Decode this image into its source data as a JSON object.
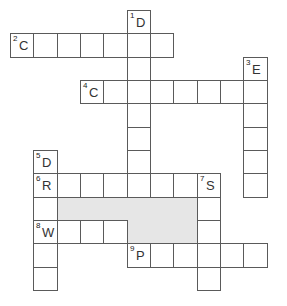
{
  "puzzle": {
    "type": "crossword",
    "cell_size": 23.33,
    "origin": [
      10,
      10
    ],
    "line_color": "#5a5a5a",
    "shade_color": "#e6e6e6",
    "entries": [
      {
        "number": "1",
        "letter": "D",
        "direction": "down",
        "col": 5,
        "row": 0,
        "length": 8
      },
      {
        "number": "2",
        "letter": "C",
        "direction": "across",
        "col": 0,
        "row": 1,
        "length": 7
      },
      {
        "number": "3",
        "letter": "E",
        "direction": "down",
        "col": 10,
        "row": 2,
        "length": 6
      },
      {
        "number": "4",
        "letter": "C",
        "direction": "across",
        "col": 3,
        "row": 3,
        "length": 8
      },
      {
        "number": "5",
        "letter": "D",
        "direction": "down",
        "col": 1,
        "row": 6,
        "length": 6
      },
      {
        "number": "6",
        "letter": "R",
        "direction": "across",
        "col": 1,
        "row": 7,
        "length": 8
      },
      {
        "number": "7",
        "letter": "S",
        "direction": "down",
        "col": 8,
        "row": 7,
        "length": 5
      },
      {
        "number": "8",
        "letter": "W",
        "direction": "across",
        "col": 1,
        "row": 9,
        "length": 4
      },
      {
        "number": "9",
        "letter": "P",
        "direction": "across",
        "col": 5,
        "row": 10,
        "length": 6
      }
    ],
    "shaded_regions": [
      {
        "col": 2,
        "row": 8,
        "cols": 6,
        "rows": 1
      },
      {
        "col": 5,
        "row": 9,
        "cols": 3,
        "rows": 1
      }
    ]
  }
}
